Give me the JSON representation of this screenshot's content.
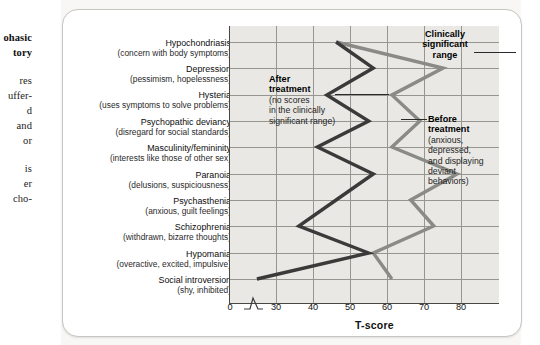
{
  "left_column": {
    "heading_lines": [
      "ohasic",
      "tory"
    ],
    "body_lines": [
      "res",
      "uffer-",
      "d",
      "and",
      "or",
      "is",
      "er",
      "cho-"
    ]
  },
  "figure": {
    "x_axis_title": "T-score",
    "x_ticks": [
      "0",
      "30",
      "40",
      "50",
      "60",
      "70",
      "80"
    ],
    "axis_break_symbol": "zigzag-break",
    "categories": [
      {
        "num": "1",
        "name": "Hypochondriasis",
        "desc": "(concern with body symptoms)"
      },
      {
        "num": "2",
        "name": "Depression",
        "desc": "(pessimism, hopelessness)"
      },
      {
        "num": "3",
        "name": "Hysteria",
        "desc": "(uses symptoms to solve problems)"
      },
      {
        "num": "4",
        "name": "Psychopathic deviancy",
        "desc": "(disregard for social standards)"
      },
      {
        "num": "5",
        "name": "Masculinity/femininity",
        "desc": "(interests like those of other sex)"
      },
      {
        "num": "6",
        "name": "Paranoia",
        "desc": "(delusions, suspiciousness)"
      },
      {
        "num": "7",
        "name": "Psychasthenia",
        "desc": "(anxious, guilt feelings)"
      },
      {
        "num": "8",
        "name": "Schizophrenia",
        "desc": "(withdrawn, bizarre thoughts)"
      },
      {
        "num": "9",
        "name": "Hypomania",
        "desc": "(overactive, excited, impulsive)"
      },
      {
        "num": "10",
        "name": "Social introversion",
        "desc": "(shy, inhibited)"
      }
    ],
    "annotations": {
      "clinically_significant": {
        "title": "Clinically\nsignificant\nrange"
      },
      "after_treatment": {
        "title": "After\ntreatment",
        "sub": "(no scores\nin the clinically\nsignificant range)"
      },
      "before_treatment": {
        "title": "Before\ntreatment",
        "sub": "(anxious,\ndepressed,\nand displaying\ndeviant\nbehaviors)"
      }
    }
  },
  "chart_data": {
    "type": "line",
    "title": "",
    "xlabel": "T-score",
    "ylabel": "",
    "orientation": "horizontal-categories-on-y",
    "xlim": [
      27,
      85
    ],
    "axis_break": {
      "between": [
        0,
        30
      ]
    },
    "grid": true,
    "legend": "inline-annotations",
    "categories": [
      "Hypochondriasis",
      "Depression",
      "Hysteria",
      "Psychopathic deviancy",
      "Masculinity/femininity",
      "Paranoia",
      "Psychasthenia",
      "Schizophrenia",
      "Hypomania",
      "Social introversion"
    ],
    "category_numbers": [
      1,
      2,
      3,
      4,
      5,
      6,
      7,
      8,
      9,
      10
    ],
    "tick_values": [
      30,
      40,
      50,
      60,
      70,
      80
    ],
    "series": [
      {
        "name": "Before treatment",
        "color": "#8a8a86",
        "description": "(anxious, depressed, and displaying deviant behaviors)",
        "values": [
          50,
          73,
          62,
          68,
          62,
          76,
          66,
          71,
          58,
          62
        ]
      },
      {
        "name": "After treatment",
        "color": "#3a3a3a",
        "description": "(no scores in the clinically significant range)",
        "values": [
          50,
          58,
          48,
          57,
          46,
          58,
          50,
          42,
          57,
          33
        ]
      }
    ],
    "colors": {
      "before": "#8a8a86",
      "after": "#3a3a3a",
      "plot_bg": "#e9e8e4",
      "grid": "#97958f"
    }
  }
}
